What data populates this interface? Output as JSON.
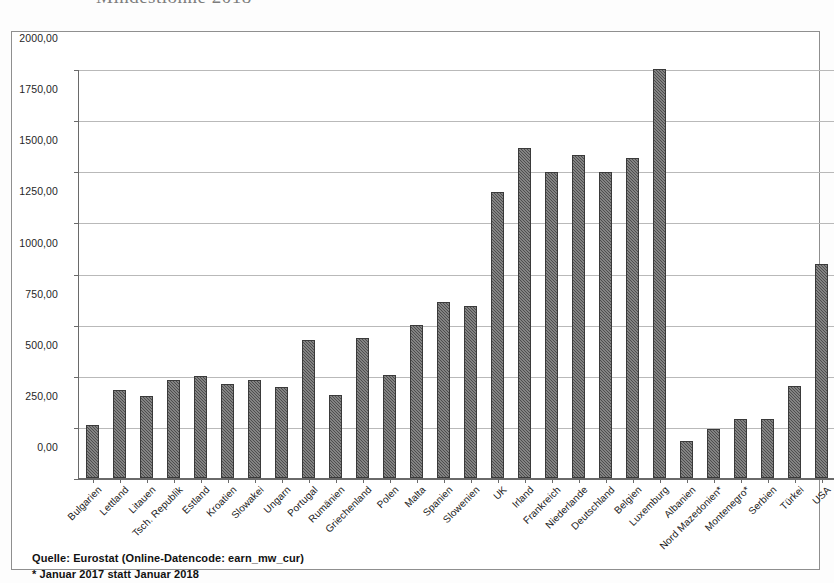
{
  "title": "Mindestlöhne 2018",
  "axis": {
    "y_ticks": [
      "2000,00",
      "1750,00",
      "1500,00",
      "1250,00",
      "1000,00",
      "750,00",
      "500,00",
      "250,00",
      "0,00"
    ],
    "y_min": 0,
    "y_max": 2000,
    "y_step": 250
  },
  "footnotes": {
    "source": "Quelle: Eurostat (Online-Datencode: earn_mw_cur)",
    "note": "* Januar 2017 statt Januar 2018"
  },
  "chart_data": {
    "type": "bar",
    "title": "Mindestlöhne 2018",
    "xlabel": "",
    "ylabel": "",
    "ylim": [
      0,
      2000
    ],
    "ytick_step": 250,
    "grid": true,
    "legend": "none",
    "bar_color": "#4d4d4d",
    "categories": [
      "Bulgarien",
      "Lettland",
      "Litauen",
      "Tsch. Republik",
      "Estland",
      "Kroatien",
      "Slowakei",
      "Ungarn",
      "Portugal",
      "Rumänien",
      "Griechenland",
      "Polen",
      "Malta",
      "Spanien",
      "Slowenien",
      "UK",
      "Irland",
      "Frankreich",
      "Niederlande",
      "Deutschland",
      "Belgien",
      "Luxemburg",
      "Albanien",
      "Nord Mazedonien*",
      "Montenegro*",
      "Serbien",
      "Türkei",
      "USA"
    ],
    "values": [
      261,
      430,
      400,
      478,
      500,
      462,
      480,
      445,
      677,
      408,
      684,
      503,
      748,
      859,
      843,
      1401,
      1614,
      1498,
      1578,
      1498,
      1563,
      1999,
      180,
      239,
      288,
      287,
      449,
      1048
    ]
  }
}
